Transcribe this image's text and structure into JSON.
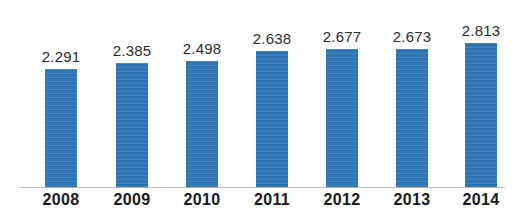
{
  "chart_data": {
    "type": "bar",
    "title": "",
    "subtitle": "",
    "xlabel": "",
    "ylabel": "",
    "grid": false,
    "legend": false,
    "legend_position": "none",
    "axis_line": true,
    "bar_color": "#2f77b4",
    "value_label_color": "#2b2b2b",
    "category_label_color": "#17191c",
    "background_color": "#ffffff",
    "ylim": [
      2.0,
      2.95
    ],
    "categories": [
      "2008",
      "2009",
      "2010",
      "2011",
      "2012",
      "2013",
      "2014"
    ],
    "values": [
      2.291,
      2.385,
      2.498,
      2.638,
      2.677,
      2.673,
      2.813
    ],
    "value_labels": [
      "2.291",
      "2.385",
      "2.498",
      "2.638",
      "2.677",
      "2.673",
      "2.813"
    ],
    "bars": [
      {
        "category": "2008",
        "value": 2.291,
        "label": "2.291"
      },
      {
        "category": "2009",
        "value": 2.385,
        "label": "2.385"
      },
      {
        "category": "2010",
        "value": 2.498,
        "label": "2.498"
      },
      {
        "category": "2011",
        "value": 2.638,
        "label": "2.638"
      },
      {
        "category": "2012",
        "value": 2.677,
        "label": "2.677"
      },
      {
        "category": "2013",
        "value": 2.673,
        "label": "2.673"
      },
      {
        "category": "2014",
        "value": 2.813,
        "label": "2.813"
      }
    ]
  },
  "layout": {
    "bar_width_px": 32,
    "bar_centers_px": [
      61,
      132,
      202,
      272,
      342,
      412,
      481
    ],
    "bar_tops_px": [
      68,
      62,
      60,
      50,
      48,
      48,
      42
    ],
    "baseline_y_px": 187
  }
}
